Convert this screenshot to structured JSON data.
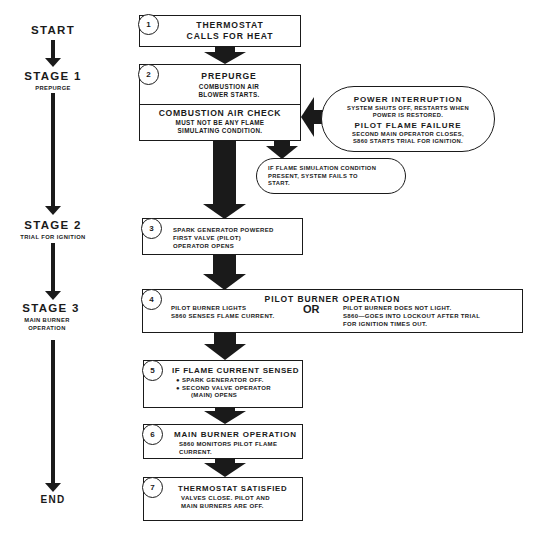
{
  "timeline": {
    "start": "START",
    "stages": [
      {
        "label": "STAGE 1",
        "sub": [
          "PREPURGE"
        ]
      },
      {
        "label": "STAGE 2",
        "sub": [
          "TRIAL FOR IGNITION"
        ]
      },
      {
        "label": "STAGE 3",
        "sub": [
          "MAIN BURNER",
          "OPERATION"
        ]
      }
    ],
    "end": "END"
  },
  "steps": [
    {
      "number": "1",
      "title_lines": [
        "THERMOSTAT",
        "CALLS FOR HEAT"
      ]
    },
    {
      "number": "2",
      "title": "PREPURGE",
      "body": [
        "COMBUSTION AIR",
        "BLOWER STARTS."
      ],
      "check_title": "COMBUSTION AIR CHECK",
      "check_body": [
        "MUST NOT BE ANY FLAME",
        "SIMULATING CONDITION."
      ]
    },
    {
      "number": "3",
      "body": [
        "SPARK GENERATOR POWERED",
        "FIRST VALVE (PILOT)",
        "OPERATOR OPENS"
      ]
    },
    {
      "number": "4",
      "title": "PILOT BURNER OPERATION",
      "left": [
        "PILOT BURNER LIGHTS",
        "S860 SENSES FLAME CURRENT."
      ],
      "or": "OR",
      "right": [
        "PILOT BURNER DOES NOT LIGHT.",
        "S860—GOES INTO LOCKOUT AFTER TRIAL",
        "FOR IGNITION TIMES OUT."
      ]
    },
    {
      "number": "5",
      "title": "IF FLAME CURRENT SENSED",
      "bullets": [
        "SPARK GENERATOR OFF.",
        "SECOND VALVE OPERATOR"
      ],
      "continuation": "(MAIN) OPENS"
    },
    {
      "number": "6",
      "title": "MAIN BURNER OPERATION",
      "body": [
        "S860 MONITORS PILOT FLAME",
        "CURRENT."
      ]
    },
    {
      "number": "7",
      "title": "THERMOSTAT SATISFIED",
      "body": [
        "VALVES CLOSE. PILOT AND",
        "MAIN BURNERS ARE OFF."
      ]
    }
  ],
  "side_notes": {
    "interrupt": {
      "title1": "POWER INTERRUPTION",
      "body1": [
        "SYSTEM SHUTS OFF, RESTARTS WHEN",
        "POWER IS RESTORED."
      ],
      "title2": "PILOT FLAME FAILURE",
      "body2": [
        "SECOND MAIN OPERATOR CLOSES,",
        "S860 STARTS TRIAL FOR IGNITION."
      ]
    },
    "flame_sim": [
      "IF FLAME SIMULATION CONDITION",
      "PRESENT, SYSTEM FAILS TO",
      "START."
    ]
  },
  "colors": {
    "ink": "#1a1a1a",
    "background": "#ffffff"
  }
}
